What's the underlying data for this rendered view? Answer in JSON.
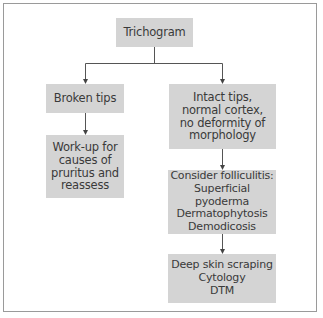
{
  "diagram": {
    "type": "flowchart",
    "nodes": [
      {
        "id": "trichogram",
        "label": "Trichogram"
      },
      {
        "id": "broken_tips",
        "label": "Broken tips"
      },
      {
        "id": "workup",
        "label": "Work-up for\ncauses of\npruritus and\nreassess"
      },
      {
        "id": "intact_tips",
        "label": "Intact tips,\nnormal cortex,\nno deformity of\nmorphology"
      },
      {
        "id": "folliculitis",
        "label": "Consider folliculitis:\nSuperficial pyoderma\nDermatophytosis\nDemodicosis"
      },
      {
        "id": "tests",
        "label": "Deep skin scraping\nCytology\nDTM"
      }
    ],
    "edges": [
      {
        "from": "trichogram",
        "to": "broken_tips"
      },
      {
        "from": "trichogram",
        "to": "intact_tips"
      },
      {
        "from": "broken_tips",
        "to": "workup"
      },
      {
        "from": "intact_tips",
        "to": "folliculitis"
      },
      {
        "from": "folliculitis",
        "to": "tests"
      }
    ],
    "colors": {
      "box_fill": "#d4d4d4",
      "text": "#3a3a3a",
      "line": "#555555",
      "frame": "#9a9a9a"
    }
  }
}
